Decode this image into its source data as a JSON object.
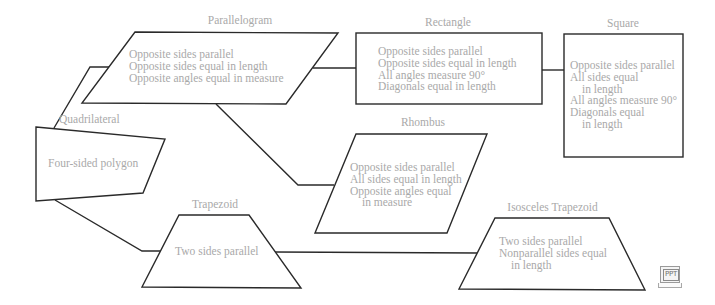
{
  "diagram": {
    "type": "quadrilateral-hierarchy",
    "colors": {
      "outline": "#2a2a2a",
      "text": "#a9a9a9",
      "background": "#ffffff"
    },
    "nodes": {
      "parallelogram": {
        "title": "Parallelogram",
        "lines": [
          "Opposite sides parallel",
          "Opposite sides equal in length",
          "Opposite angles equal in measure"
        ]
      },
      "rectangle": {
        "title": "Rectangle",
        "lines": [
          "Opposite sides parallel",
          "Opposite sides equal in length",
          "All angles measure 90°",
          "Diagonals equal in length"
        ]
      },
      "square": {
        "title": "Square",
        "lines": [
          "Opposite sides parallel",
          "All sides equal",
          "in length",
          "All angles measure 90°",
          "Diagonals equal",
          "in length"
        ]
      },
      "quadrilateral": {
        "title": "Quadrilateral",
        "lines": [
          "Four-sided polygon"
        ]
      },
      "rhombus": {
        "title": "Rhombus",
        "lines": [
          "Opposite sides parallel",
          "All sides equal in length",
          "Opposite angles equal",
          "in measure"
        ]
      },
      "trapezoid": {
        "title": "Trapezoid",
        "lines": [
          "Two sides parallel"
        ]
      },
      "isosceles_trapezoid": {
        "title": "Isosceles Trapezoid",
        "lines": [
          "Two sides parallel",
          "Nonparallel sides equal",
          "in length"
        ]
      }
    },
    "edges": [
      {
        "from": "quadrilateral",
        "to": "parallelogram"
      },
      {
        "from": "quadrilateral",
        "to": "trapezoid"
      },
      {
        "from": "parallelogram",
        "to": "rectangle"
      },
      {
        "from": "parallelogram",
        "to": "rhombus"
      },
      {
        "from": "rectangle",
        "to": "square"
      },
      {
        "from": "trapezoid",
        "to": "isosceles_trapezoid"
      }
    ],
    "badge": {
      "label": "PPT",
      "icon": "ppt-laptop-icon"
    }
  }
}
